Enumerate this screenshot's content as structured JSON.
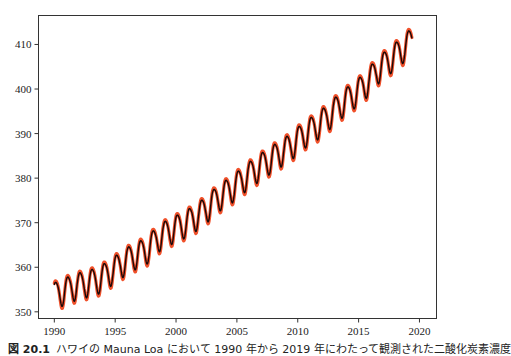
{
  "chart_data": {
    "type": "line",
    "title": "",
    "xlabel": "",
    "ylabel": "",
    "xlim": [
      1988.7,
      2021.4
    ],
    "ylim": [
      348.5,
      416.5
    ],
    "x_ticks": [
      1990,
      1995,
      2000,
      2005,
      2010,
      2015,
      2020
    ],
    "y_ticks": [
      350,
      360,
      370,
      380,
      390,
      400,
      410
    ],
    "grid": false,
    "legend": null,
    "x_range_data": [
      1990.0,
      2019.4
    ],
    "series": [
      {
        "name": "observed",
        "color": "#f0502a",
        "line_width": 3.2,
        "seasonal_amplitude": 3.4,
        "annual_mean_x": [
          1990,
          1991,
          1992,
          1993,
          1994,
          1995,
          1996,
          1997,
          1998,
          1999,
          2000,
          2001,
          2002,
          2003,
          2004,
          2005,
          2006,
          2007,
          2008,
          2009,
          2010,
          2011,
          2012,
          2013,
          2014,
          2015,
          2016,
          2017,
          2018,
          2019
        ],
        "annual_mean_y": [
          354.4,
          355.6,
          356.4,
          357.1,
          358.8,
          360.8,
          362.6,
          363.7,
          366.6,
          368.3,
          369.5,
          371.1,
          373.2,
          375.8,
          377.5,
          379.8,
          381.9,
          383.8,
          385.6,
          387.4,
          389.9,
          391.6,
          393.9,
          396.5,
          398.6,
          400.8,
          404.2,
          406.5,
          408.7,
          411.4
        ]
      },
      {
        "name": "fit",
        "color": "#1a0a0a",
        "line_width": 1.4,
        "seasonal_amplitude": 3.0
      }
    ],
    "start_value": 353,
    "end_value": 414
  },
  "caption": {
    "figure_number": "図 20.1",
    "text": "ハワイの Mauna Loa において 1990 年から 2019 年にわたって観測された二酸化炭素濃度"
  }
}
